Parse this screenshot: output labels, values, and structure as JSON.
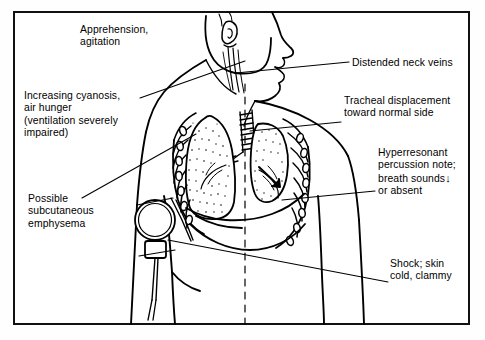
{
  "figure": {
    "frame_color": "#111111",
    "background_color": "#ffffff",
    "ink_color": "#000000"
  },
  "labels": {
    "apprehension": "Apprehension,\nagitation",
    "cyanosis": "Increasing cyanosis,\nair hunger\n(ventilation severely\nimpaired)",
    "emphysema": "Possible\nsubcutaneous\nemphysema",
    "neck_veins": "Distended neck veins",
    "tracheal": "Tracheal displacement\ntoward normal side",
    "hyperresonant_line1": "Hyperresonant",
    "hyperresonant_line2": "percussion note;",
    "hyperresonant_line3": "breath sounds",
    "hyperresonant_arrow": "↓",
    "hyperresonant_line4": "or absent",
    "shock": "Shock; skin\ncold, clammy"
  },
  "anatomy": {
    "head": "head-profile-facing-right",
    "neck_veins": "distended-jugular-veins",
    "trachea": "trachea-with-cartilage-rings-displaced",
    "lung_normal": "stippled-normal-lung-left-of-viewer",
    "lung_collapsed": "collapsed-lung-right-of-viewer",
    "ribs": "rib-cage-outline",
    "diaphragm": "diaphragm-curve",
    "midline": "dashed-vertical-midline",
    "chest_device": "chest-drain-device-with-tube",
    "shift_arrow": "mediastinal-shift-arrow"
  }
}
